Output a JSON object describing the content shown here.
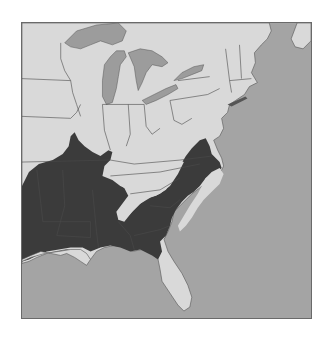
{
  "map": {
    "region": "Eastern United States",
    "colors": {
      "ocean": "#a4a4a4",
      "land": "#d9d9d9",
      "lakes": "#9c9c9c",
      "range": "#3b3b3b",
      "border": "#555555",
      "frame": "#6a6a6a",
      "background": "#ffffff"
    },
    "legend": []
  }
}
